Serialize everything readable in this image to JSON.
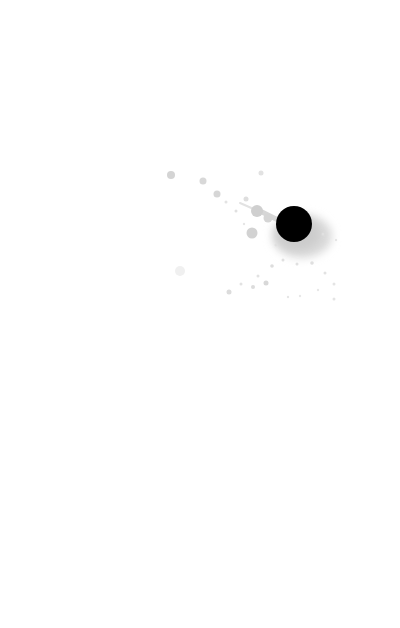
{
  "scene": {
    "width": 400,
    "height": 628,
    "background": "#ffffff",
    "description": "Ink splatter: solid black dot with light gray spray droplets on white"
  },
  "blot": {
    "cx": 294,
    "cy": 224,
    "r": 18,
    "color": "#000000",
    "halo": {
      "cx": 302,
      "cy": 236,
      "rx": 30,
      "ry": 22,
      "color": "#d9d9d9"
    }
  },
  "droplets": [
    {
      "cx": 171,
      "cy": 175,
      "r": 4.0,
      "color": "#d4d4d4"
    },
    {
      "cx": 203,
      "cy": 181,
      "r": 3.5,
      "color": "#d8d8d8"
    },
    {
      "cx": 217,
      "cy": 194,
      "r": 3.5,
      "color": "#d6d6d6"
    },
    {
      "cx": 246,
      "cy": 199,
      "r": 2.5,
      "color": "#dedede"
    },
    {
      "cx": 261,
      "cy": 173,
      "r": 2.5,
      "color": "#e2e2e2"
    },
    {
      "cx": 257,
      "cy": 211,
      "r": 6.0,
      "color": "#cfcfcf"
    },
    {
      "cx": 268,
      "cy": 218,
      "r": 4.5,
      "color": "#d5d5d5"
    },
    {
      "cx": 252,
      "cy": 233,
      "r": 5.5,
      "color": "#d2d2d2"
    },
    {
      "cx": 236,
      "cy": 211,
      "r": 1.5,
      "color": "#e0e0e0"
    },
    {
      "cx": 226,
      "cy": 202,
      "r": 1.5,
      "color": "#e3e3e3"
    },
    {
      "cx": 180,
      "cy": 271,
      "r": 5.0,
      "color": "#f0f0f0"
    },
    {
      "cx": 229,
      "cy": 292,
      "r": 2.5,
      "color": "#dcdcdc"
    },
    {
      "cx": 241,
      "cy": 284,
      "r": 1.5,
      "color": "#e2e2e2"
    },
    {
      "cx": 253,
      "cy": 287,
      "r": 2.0,
      "color": "#dcdcdc"
    },
    {
      "cx": 266,
      "cy": 283,
      "r": 2.5,
      "color": "#d8d8d8"
    },
    {
      "cx": 258,
      "cy": 276,
      "r": 1.5,
      "color": "#e2e2e2"
    },
    {
      "cx": 272,
      "cy": 266,
      "r": 1.8,
      "color": "#dddddd"
    },
    {
      "cx": 283,
      "cy": 260,
      "r": 1.5,
      "color": "#e0e0e0"
    },
    {
      "cx": 297,
      "cy": 264,
      "r": 1.5,
      "color": "#e0e0e0"
    },
    {
      "cx": 312,
      "cy": 263,
      "r": 1.8,
      "color": "#dfdfdf"
    },
    {
      "cx": 325,
      "cy": 273,
      "r": 1.5,
      "color": "#e2e2e2"
    },
    {
      "cx": 334,
      "cy": 284,
      "r": 1.5,
      "color": "#e4e4e4"
    },
    {
      "cx": 323,
      "cy": 234,
      "r": 1.5,
      "color": "#e0e0e0"
    },
    {
      "cx": 336,
      "cy": 240,
      "r": 1.2,
      "color": "#e6e6e6"
    },
    {
      "cx": 288,
      "cy": 297,
      "r": 1.2,
      "color": "#e6e6e6"
    },
    {
      "cx": 300,
      "cy": 296,
      "r": 1.2,
      "color": "#e8e8e8"
    },
    {
      "cx": 334,
      "cy": 299,
      "r": 1.5,
      "color": "#e4e4e4"
    },
    {
      "cx": 318,
      "cy": 290,
      "r": 1.2,
      "color": "#e8e8e8"
    },
    {
      "cx": 276,
      "cy": 245,
      "r": 1.5,
      "color": "#e0e0e0"
    },
    {
      "cx": 244,
      "cy": 224,
      "r": 1.2,
      "color": "#e6e6e6"
    }
  ],
  "streaks": [
    {
      "x1": 262,
      "y1": 212,
      "x2": 282,
      "y2": 222,
      "w": 5,
      "color": "#d6d6d6"
    },
    {
      "x1": 240,
      "y1": 203,
      "x2": 256,
      "y2": 210,
      "w": 2,
      "color": "#e2e2e2"
    }
  ]
}
